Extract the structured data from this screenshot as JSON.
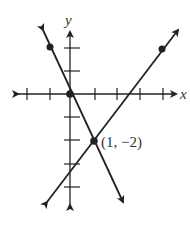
{
  "graph": {
    "x_axis_label": "x",
    "y_axis_label": "y",
    "origin_px": [
      70,
      94
    ],
    "unit_px": 23,
    "x_ticks": [
      -2,
      -1,
      1,
      2,
      3,
      4
    ],
    "y_ticks": [
      2,
      1,
      -1,
      -2,
      -3,
      -4
    ],
    "lines": [
      {
        "name": "line-decreasing",
        "slope": -2,
        "intercept": 0,
        "marked_points": [
          [
            -1,
            2
          ],
          [
            0,
            0
          ],
          [
            1,
            -2
          ]
        ]
      },
      {
        "name": "line-increasing",
        "slope": 1,
        "intercept": -3,
        "marked_points": [
          [
            1,
            -2
          ],
          [
            4,
            1
          ]
        ]
      }
    ],
    "intersection": {
      "x": 1,
      "y": -2,
      "label": "(1, −2)"
    },
    "color": "#222222"
  }
}
